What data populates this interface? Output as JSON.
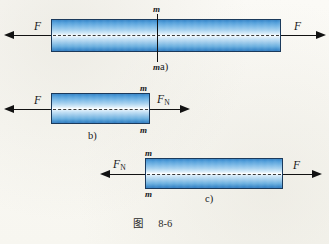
{
  "figure": {
    "caption_label": "图",
    "caption_number": "8-6",
    "background_color": "#faf9f5",
    "bar_outline_color": "#1b3a5c",
    "bar_gradient_edge_color": "#2b78bf",
    "bar_gradient_center_color": "#ffffff",
    "arrow_color": "#121212",
    "text_color": "#17181a"
  },
  "panels": [
    {
      "id": "a",
      "part_label": "a)",
      "left_force": "F",
      "right_force": "F",
      "section_top_label": "m",
      "section_bottom_label": "m",
      "has_section_cut_line": true
    },
    {
      "id": "b",
      "part_label": "b)",
      "left_force": "F",
      "right_force_base": "F",
      "right_force_sub": "N",
      "section_top_label": "m",
      "section_bottom_label": "m",
      "has_section_cut_line": false
    },
    {
      "id": "c",
      "part_label": "c)",
      "left_force_base": "F",
      "left_force_sub": "N",
      "right_force": "F",
      "section_top_label": "m",
      "section_bottom_label": "m",
      "has_section_cut_line": false
    }
  ]
}
